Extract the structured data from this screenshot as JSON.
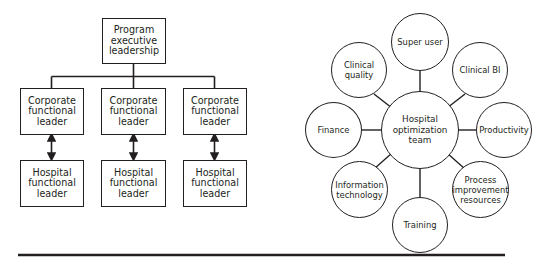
{
  "left_diagram": {
    "top": {
      "label": "Program\nexecutive\nleadership"
    },
    "columns": [
      {
        "corporate": "Corporate\nfunctional\nleader",
        "hospital": "Hospital\nfunctional\nleader"
      },
      {
        "corporate": "Corporate\nfunctional\nleader",
        "hospital": "Hospital\nfunctional\nleader"
      },
      {
        "corporate": "Corporate\nfunctional\nleader",
        "hospital": "Hospital\nfunctional\nleader"
      }
    ]
  },
  "right_diagram": {
    "center": {
      "label": "Hospital\noptimization\nteam"
    },
    "satellites": [
      {
        "label": "Super user"
      },
      {
        "label": "Clinical BI"
      },
      {
        "label": "Productivity"
      },
      {
        "label": "Process\nimprovement\nresources"
      },
      {
        "label": "Training"
      },
      {
        "label": "Information\ntechnology"
      },
      {
        "label": "Finance"
      },
      {
        "label": "Clinical\nquality"
      }
    ]
  },
  "colors": {
    "stroke": "#231f20",
    "background": "#ffffff"
  }
}
